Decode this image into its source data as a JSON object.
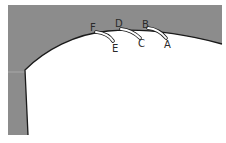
{
  "diagram": {
    "type": "cross-section",
    "colors": {
      "region_fill": "#8c8c8c",
      "cavity_fill": "#ffffff",
      "outline": "#1a1a1a",
      "marker_fill": "#ffffff"
    },
    "labels": [
      {
        "id": "A",
        "text": "A"
      },
      {
        "id": "B",
        "text": "B"
      },
      {
        "id": "C",
        "text": "C"
      },
      {
        "id": "D",
        "text": "D"
      },
      {
        "id": "E",
        "text": "E"
      },
      {
        "id": "F",
        "text": "F"
      }
    ],
    "markers": [
      {
        "from": "B",
        "to": "A"
      },
      {
        "from": "D",
        "to": "C"
      },
      {
        "from": "F",
        "to": "E"
      }
    ]
  }
}
